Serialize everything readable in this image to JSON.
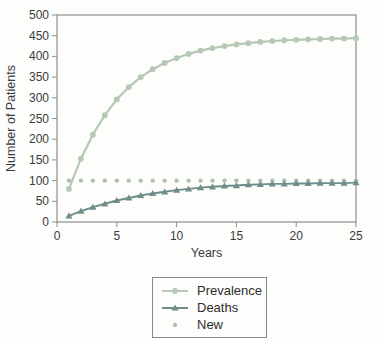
{
  "chart_data": {
    "type": "line",
    "title": "",
    "xlabel": "Years",
    "ylabel": "Number of Patients",
    "xlim": [
      0,
      25
    ],
    "ylim": [
      0,
      500
    ],
    "x_ticks": [
      0,
      5,
      10,
      15,
      20,
      25
    ],
    "y_ticks": [
      0,
      50,
      100,
      150,
      200,
      250,
      300,
      350,
      400,
      450,
      500
    ],
    "grid": false,
    "legend_position": "bottom",
    "x": [
      1,
      2,
      3,
      4,
      5,
      6,
      7,
      8,
      9,
      10,
      11,
      12,
      13,
      14,
      15,
      16,
      17,
      18,
      19,
      20,
      21,
      22,
      23,
      24,
      25
    ],
    "series": [
      {
        "name": "Prevalence",
        "color": "#b6c9b5",
        "marker": "circle",
        "line": true,
        "values": [
          80,
          153,
          211,
          258,
          296,
          326,
          350,
          369,
          384,
          396,
          406,
          414,
          420,
          425,
          429,
          432,
          435,
          437,
          439,
          440,
          441,
          442,
          443,
          443,
          444
        ]
      },
      {
        "name": "Deaths",
        "color": "#6e8d8b",
        "marker": "triangle",
        "line": true,
        "values": [
          15,
          26,
          36,
          44,
          52,
          58,
          64,
          69,
          73,
          77,
          80,
          83,
          85,
          87,
          88,
          90,
          91,
          92,
          92,
          93,
          93,
          94,
          94,
          94,
          95
        ]
      },
      {
        "name": "New",
        "color": "#adc1ad",
        "marker": "dot",
        "line": false,
        "values": [
          100,
          100,
          100,
          100,
          100,
          100,
          100,
          100,
          100,
          100,
          100,
          100,
          100,
          100,
          100,
          100,
          100,
          100,
          100,
          100,
          100,
          100,
          100,
          100,
          100
        ]
      }
    ]
  },
  "colors": {
    "axis": "#8e8e8e",
    "text": "#3b3b3b",
    "background": "#fdfdfb",
    "legend_border": "#8a8a8a"
  }
}
